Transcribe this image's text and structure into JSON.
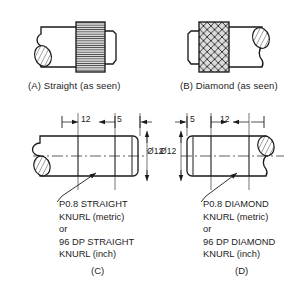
{
  "figure": {
    "title_absent": true,
    "background_color": "#ffffff",
    "line_color": "#1a1a1a",
    "knurl_fill_color": "#d9d9d9"
  },
  "views": {
    "a": {
      "caption": "(A) Straight (as seen)",
      "knurl_style": "straight",
      "knurl_label": "straight-knurl-hatch"
    },
    "b": {
      "caption": "(B) Diamond (as seen)",
      "knurl_style": "diamond",
      "knurl_label": "diamond-knurl-hatch"
    },
    "c": {
      "panel_label": "(C)",
      "dimensions": {
        "length_knurl": "12",
        "length_plain": "5",
        "diameter": "Ø12"
      },
      "note_lines": [
        "P0.8 STRAIGHT",
        "KNURL (metric)",
        "or",
        "96 DP STRAIGHT",
        "KNURL (inch)"
      ]
    },
    "d": {
      "panel_label": "(D)",
      "dimensions": {
        "length_plain": "5",
        "length_knurl": "12",
        "diameter": "Ø12"
      },
      "note_lines": [
        "P0.8 DIAMOND",
        "KNURL (metric)",
        "or",
        "96 DP DIAMOND",
        "KNURL (inch)"
      ]
    }
  }
}
